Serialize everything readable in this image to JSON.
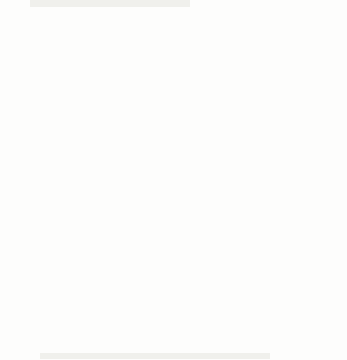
{
  "figure": {
    "title": "",
    "background_color": "#fdfdfc",
    "ink_color": "#161616"
  },
  "chart_data": {
    "type": "scatter",
    "subtype": "direction-field",
    "title": "",
    "xlabel": "",
    "ylabel": "",
    "xlim": [
      -5,
      5
    ],
    "ylim": [
      -5,
      5
    ],
    "grid": false,
    "legend": null,
    "axes": {
      "x_axis_position": 0,
      "y_axis_position": 0,
      "x_tick_interval": 0.5,
      "y_tick_interval": 0.5,
      "x_labeled_ticks": [
        -5,
        -4,
        -3,
        -2,
        -1,
        0,
        1,
        2,
        3,
        4,
        5
      ],
      "y_labeled_ticks": [
        -5,
        -4,
        -3,
        -2,
        -1,
        0,
        1,
        2,
        3,
        4,
        5
      ],
      "x_tick_labels": [
        "-5",
        "-4",
        "-3",
        "-2",
        "-1",
        "0",
        "1",
        "2",
        "3",
        "4",
        "5"
      ],
      "y_tick_labels": [
        "-5",
        "-4",
        "-3",
        "-2",
        "-1",
        "0",
        "1",
        "2",
        "3",
        "4",
        "5"
      ]
    },
    "field": {
      "x_start": -5,
      "x_end": 5,
      "x_step": 0.5,
      "y_start": -5,
      "y_end": 5,
      "y_step": 0.5,
      "samples_x": 21,
      "samples_y": 21,
      "arrow_length_px": 11,
      "arrow_head_px": 4,
      "normalized": true,
      "angle_rule": "theta = atan2(x*x - y*y, 2*x*y) measured from +x axis; arrows drawn as unit vectors",
      "description": "Normalized direction field arrows on a 21 by 21 lattice spanning -5 to 5 in both axes"
    }
  }
}
